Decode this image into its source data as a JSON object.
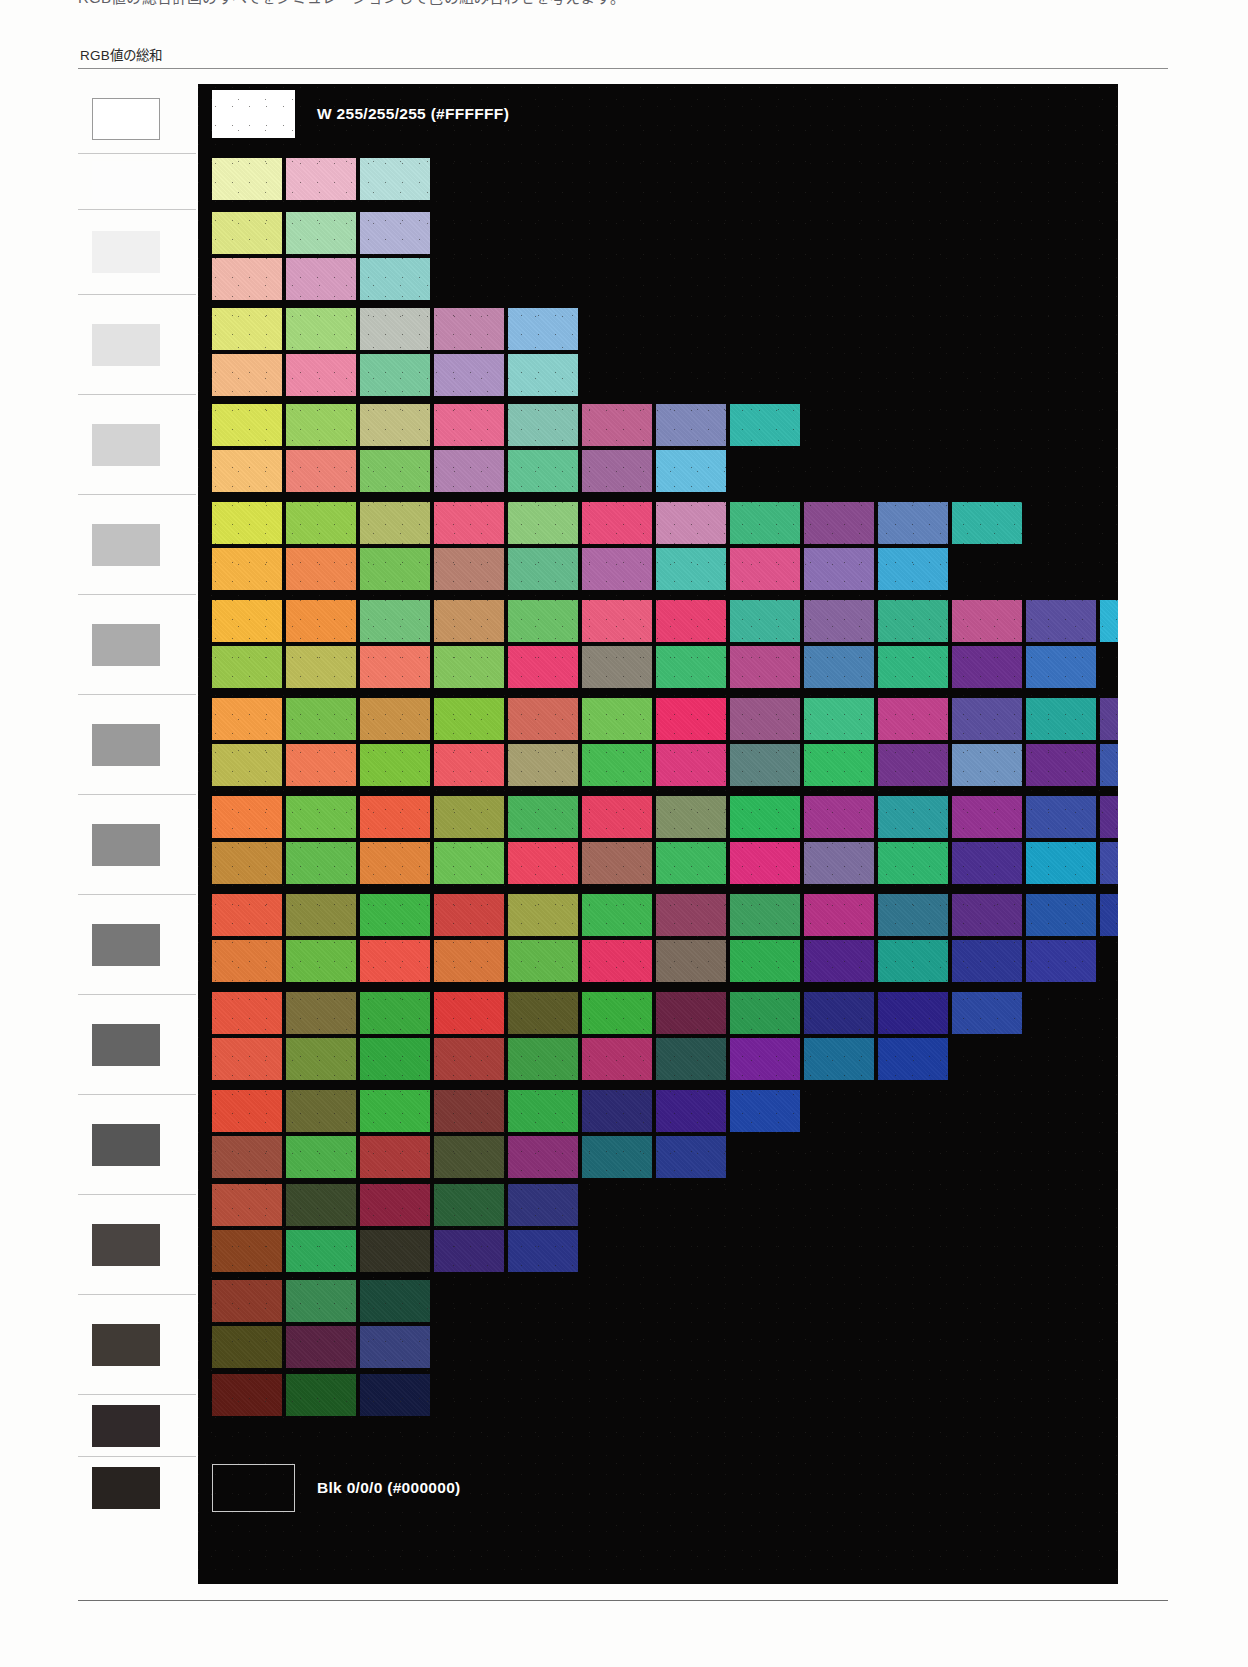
{
  "page": {
    "top_caption": "RGB値の総合計画のすべてをシミュレーションして色の組み合わせを考えます。",
    "column_heading": "RGB値の総和"
  },
  "scale": {
    "rows": [
      {
        "value": "765",
        "chip": "#ffffff",
        "outline": true,
        "height": 70
      },
      {
        "value": "714",
        "chip": "#fdfdfd",
        "outline": false,
        "height": 56
      },
      {
        "value": "663",
        "chip": "#f0f0f0",
        "outline": false,
        "height": 85
      },
      {
        "value": "612",
        "chip": "#e2e2e2",
        "outline": false,
        "height": 100
      },
      {
        "value": "561",
        "chip": "#d3d3d3",
        "outline": false,
        "height": 100
      },
      {
        "value": "510",
        "chip": "#c1c1c1",
        "outline": false,
        "height": 100
      },
      {
        "value": "459",
        "chip": "#ababab",
        "outline": false,
        "height": 100
      },
      {
        "value": "408",
        "chip": "#9a9a9a",
        "outline": false,
        "height": 100
      },
      {
        "value": "357",
        "chip": "#8d8d8d",
        "outline": false,
        "height": 100
      },
      {
        "value": "306",
        "chip": "#777777",
        "outline": false,
        "height": 100
      },
      {
        "value": "255",
        "chip": "#646464",
        "outline": false,
        "height": 100
      },
      {
        "value": "204",
        "chip": "#565656",
        "outline": false,
        "height": 100
      },
      {
        "value": "153",
        "chip": "#494441",
        "outline": false,
        "height": 100
      },
      {
        "value": "102",
        "chip": "#403a35",
        "outline": false,
        "height": 100
      },
      {
        "value": "51",
        "chip": "#30292a",
        "outline": false,
        "height": 62
      },
      {
        "value": "0",
        "chip": "#282320",
        "outline": false,
        "height": 62
      }
    ]
  },
  "chart_data": {
    "type": "table",
    "title": "RGB値の総和",
    "xlabel": "",
    "ylabel": "RGB値の総和",
    "white_label": "W  255/255/255 (#FFFFFF)",
    "black_label": "Blk  0/0/0 (#000000)",
    "bands": [
      {
        "sum": 765,
        "top": 6,
        "rows": [
          []
        ],
        "special": "white"
      },
      {
        "sum": 714,
        "top": 74,
        "rows": [
          [
            "#eff5b5",
            "#efb8cc",
            "#b6e0dc"
          ]
        ]
      },
      {
        "sum": 663,
        "top": 128,
        "rows": [
          [
            "#dfe887",
            "#a7dcaf",
            "#b3b4d8"
          ],
          [
            "#f3b9ad",
            "#d89cc0",
            "#8fd2cd"
          ]
        ]
      },
      {
        "sum": 612,
        "top": 224,
        "rows": [
          [
            "#e2e878",
            "#a4d97c",
            "#bfc4bb",
            "#c387ae",
            "#89bbe3"
          ],
          [
            "#f6bb87",
            "#ef8aa9",
            "#79c99d",
            "#ae93c5",
            "#8bd2cd"
          ]
        ]
      },
      {
        "sum": 561,
        "top": 320,
        "rows": [
          [
            "#dbe556",
            "#9ad161",
            "#c3c185",
            "#ea6b93",
            "#85c4b3",
            "#c16391",
            "#8089bb",
            "#33b8ab"
          ],
          [
            "#f9c274",
            "#ef8478",
            "#7ec664",
            "#b383b3",
            "#63c494",
            "#a0699d",
            "#67c0e2"
          ]
        ]
      },
      {
        "sum": 510,
        "top": 418,
        "rows": [
          [
            "#d9e34b",
            "#94cd4c",
            "#b4bc6a",
            "#ee5f80",
            "#8fcc7c",
            "#eb4d7c",
            "#cc8ab4",
            "#40b87f",
            "#8a4b8f",
            "#6283bc",
            "#32b5a5"
          ],
          [
            "#f8b544",
            "#f2894e",
            "#76c257",
            "#b88171",
            "#65bb8d",
            "#b069a7",
            "#4fc1b2",
            "#e0548d",
            "#8c70b5",
            "#3eabd8"
          ]
        ]
      },
      {
        "sum": 459,
        "top": 516,
        "rows": [
          [
            "#f9b93c",
            "#f4933e",
            "#72c27b",
            "#c79461",
            "#6cc168",
            "#ec5e80",
            "#ea4072",
            "#3fb59b",
            "#88659f",
            "#37b28b",
            "#c05590",
            "#5b4fa0",
            "#2db6d7"
          ],
          [
            "#9ac84b",
            "#bdbd59",
            "#f37a67",
            "#85c65e",
            "#ed4174",
            "#8b8577",
            "#3fbc71",
            "#b74d8d",
            "#4b82b4",
            "#31b881",
            "#6b2f8e",
            "#3a72c0"
          ]
        ]
      },
      {
        "sum": 408,
        "top": 614,
        "rows": [
          [
            "#f79f45",
            "#76c04c",
            "#cb9347",
            "#85c63c",
            "#d36a5b",
            "#73c455",
            "#ef2f6a",
            "#9a5789",
            "#3fbf86",
            "#c2428d",
            "#5b4f9e",
            "#25a89c",
            "#5b3f92",
            "#3777c7"
          ],
          [
            "#bdbb52",
            "#f37a55",
            "#7dc53b",
            "#f05b65",
            "#a8a071",
            "#47bc52",
            "#de3b7f",
            "#5d8380",
            "#33bd63",
            "#73348d",
            "#7195c2",
            "#6b2d8c",
            "#3b56ab"
          ]
        ]
      },
      {
        "sum": 357,
        "top": 712,
        "rows": [
          [
            "#f68140",
            "#70c24a",
            "#f05f41",
            "#97a045",
            "#49b45b",
            "#e94265",
            "#819267",
            "#2cb95b",
            "#a23790",
            "#2b9da0",
            "#953292",
            "#3a4fa6",
            "#5a2d8b",
            "#3a5fbc"
          ],
          [
            "#c48c3b",
            "#63bc4e",
            "#e2853c",
            "#6cc254",
            "#ef4662",
            "#a2695c",
            "#3eb95f",
            "#e02f7f",
            "#7d6e9f",
            "#2fb76f",
            "#4c2f91",
            "#1aa2c7",
            "#3e4aa6"
          ]
        ]
      },
      {
        "sum": 306,
        "top": 810,
        "rows": [
          [
            "#ea5d42",
            "#8b8c3f",
            "#3fb646",
            "#cf4541",
            "#9fa548",
            "#3fb651",
            "#914262",
            "#3e9f5f",
            "#b63286",
            "#31758e",
            "#5c2e87",
            "#2656a9",
            "#283d9b"
          ],
          [
            "#e17b3b",
            "#69bb44",
            "#f05549",
            "#d9773c",
            "#62b74a",
            "#e83566",
            "#7c6c5e",
            "#2fae50",
            "#52238b",
            "#1e9f8d",
            "#2e3694",
            "#34389d"
          ]
        ]
      },
      {
        "sum": 255,
        "top": 908,
        "rows": [
          [
            "#e85640",
            "#7c703c",
            "#3aaa3e",
            "#e03b3a",
            "#5c5b28",
            "#39af3d",
            "#6b2445",
            "#2c9a50",
            "#2a2a80",
            "#2d2188",
            "#2c48a2"
          ],
          [
            "#e45b45",
            "#73923a",
            "#31a83f",
            "#a83f3a",
            "#3f9c45",
            "#b2336c",
            "#28544f",
            "#76229a",
            "#1c6d97",
            "#1d3da0"
          ]
        ]
      },
      {
        "sum": 204,
        "top": 1006,
        "rows": [
          [
            "#e44c36",
            "#6a6b33",
            "#3bb341",
            "#7c3834",
            "#34aa47",
            "#2d2a72",
            "#3d1f86",
            "#2046a8"
          ],
          [
            "#9b4e3e",
            "#4db04a",
            "#ac3a3a",
            "#4a5231",
            "#8a3076",
            "#1f6974",
            "#2a3b8f"
          ]
        ]
      },
      {
        "sum": 153,
        "top": 1100,
        "rows": [
          [
            "#b64f3c",
            "#3b4a2b",
            "#8c2240",
            "#2a6138",
            "#31347b",
            "",
            ""
          ],
          [
            "#8a4420",
            "#2fa95a",
            "#333225",
            "#3b2774",
            "#2b3489"
          ]
        ]
      },
      {
        "sum": 102,
        "top": 1196,
        "rows": [
          [
            "#8d3a2a",
            "#3a8a52",
            "#1b4a3a"
          ],
          [
            "#4f4c1c",
            "#5a2344",
            "#39427e"
          ]
        ]
      },
      {
        "sum": 51,
        "top": 1290,
        "rows": [
          [
            "#601c16",
            "#1d5a22",
            "#131a40"
          ]
        ]
      },
      {
        "sum": 0,
        "top": 1380,
        "rows": [
          []
        ],
        "special": "black"
      }
    ]
  }
}
